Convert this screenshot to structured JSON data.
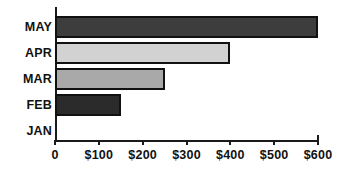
{
  "chart_data": {
    "type": "bar",
    "orientation": "horizontal",
    "title": "",
    "subtitle": "",
    "xlabel": "",
    "ylabel": "",
    "categories": [
      "JAN",
      "FEB",
      "MAR",
      "APR",
      "MAY"
    ],
    "values": [
      0,
      150,
      250,
      400,
      600
    ],
    "display_order_top_to_bottom": [
      "MAY",
      "APR",
      "MAR",
      "FEB",
      "JAN"
    ],
    "bars": [
      {
        "category": "MAY",
        "value": 600,
        "color": "#3d3d3d",
        "border": "#111111"
      },
      {
        "category": "APR",
        "value": 400,
        "color": "#d2d2d2",
        "border": "#111111"
      },
      {
        "category": "MAR",
        "value": 250,
        "color": "#a9a9a9",
        "border": "#111111"
      },
      {
        "category": "FEB",
        "value": 150,
        "color": "#2b2b2b",
        "border": "#111111"
      },
      {
        "category": "JAN",
        "value": 0,
        "color": "#ffffff",
        "border": "#111111"
      }
    ],
    "xlim": [
      0,
      600
    ],
    "x_tick_values": [
      0,
      100,
      200,
      300,
      400,
      500,
      600
    ],
    "x_tick_labels": [
      "0",
      "$100",
      "$200",
      "$300",
      "$400",
      "$500",
      "$600"
    ],
    "grid": false,
    "legend": false,
    "legend_position": "none",
    "axis_color": "#1a1a1a",
    "background_color": "#ffffff"
  },
  "axis": {
    "y_labels": [
      "MAY",
      "APR",
      "MAR",
      "FEB",
      "JAN"
    ],
    "x_labels": [
      "0",
      "$100",
      "$200",
      "$300",
      "$400",
      "$500",
      "$600"
    ]
  }
}
